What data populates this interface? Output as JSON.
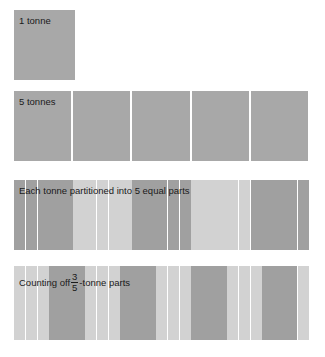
{
  "figure": {
    "background_color": "#ffffff",
    "text_color": "#1a1a1a",
    "shade_dark": "#a0a0a0",
    "shade_light": "#d2d2d2",
    "block_color": "#a8a8a8"
  },
  "rows": [
    {
      "id": "one-tonne",
      "label": "1 tonne",
      "block_count": 1,
      "cells": [
        {
          "shade": "block"
        }
      ]
    },
    {
      "id": "five-tonnes",
      "label": "5 tonnes",
      "block_count": 5,
      "cells": [
        {
          "shade": "block"
        },
        {
          "shade": "block"
        },
        {
          "shade": "block"
        },
        {
          "shade": "block"
        },
        {
          "shade": "block"
        }
      ]
    },
    {
      "id": "fifths",
      "label": "Each tonne partitioned into 5 equal parts",
      "block_count": 25,
      "group_size": 5,
      "cells": [
        {
          "shade": "dark"
        },
        {
          "shade": "dark"
        },
        {
          "shade": "dark"
        },
        {
          "shade": "dark"
        },
        {
          "shade": "dark"
        },
        {
          "shade": "light"
        },
        {
          "shade": "light"
        },
        {
          "shade": "light"
        },
        {
          "shade": "light"
        },
        {
          "shade": "light"
        },
        {
          "shade": "dark"
        },
        {
          "shade": "dark"
        },
        {
          "shade": "dark"
        },
        {
          "shade": "dark"
        },
        {
          "shade": "dark"
        },
        {
          "shade": "light"
        },
        {
          "shade": "light"
        },
        {
          "shade": "light"
        },
        {
          "shade": "light"
        },
        {
          "shade": "light"
        },
        {
          "shade": "dark"
        },
        {
          "shade": "dark"
        },
        {
          "shade": "dark"
        },
        {
          "shade": "dark"
        },
        {
          "shade": "dark"
        }
      ]
    },
    {
      "id": "three-fifths",
      "label_prefix": "Counting off",
      "fraction_numerator": "3",
      "fraction_denominator": "5",
      "label_suffix": "-tonne parts",
      "block_count": 25,
      "group_size": 3,
      "cells": [
        {
          "shade": "light"
        },
        {
          "shade": "light"
        },
        {
          "shade": "light"
        },
        {
          "shade": "dark"
        },
        {
          "shade": "dark"
        },
        {
          "shade": "dark"
        },
        {
          "shade": "light"
        },
        {
          "shade": "light"
        },
        {
          "shade": "light"
        },
        {
          "shade": "dark"
        },
        {
          "shade": "dark"
        },
        {
          "shade": "dark"
        },
        {
          "shade": "light"
        },
        {
          "shade": "light"
        },
        {
          "shade": "light"
        },
        {
          "shade": "dark"
        },
        {
          "shade": "dark"
        },
        {
          "shade": "dark"
        },
        {
          "shade": "light"
        },
        {
          "shade": "light"
        },
        {
          "shade": "light"
        },
        {
          "shade": "dark"
        },
        {
          "shade": "dark"
        },
        {
          "shade": "dark"
        },
        {
          "shade": "light"
        }
      ]
    }
  ]
}
